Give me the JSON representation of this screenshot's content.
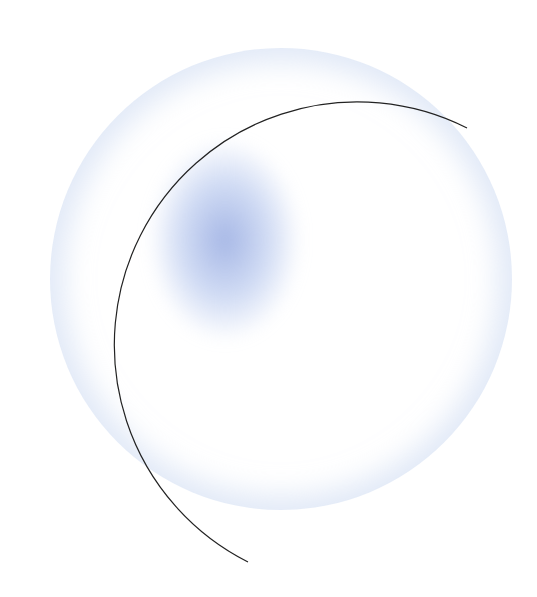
{
  "illustration": {
    "description": "Soft glowing sphere with partial dark outline arc and a blurred blue highlight",
    "colors": {
      "background": "#ffffff",
      "ring_glow": "#c8d7f0",
      "blob": "#96aae1",
      "arc_stroke": "#222222"
    }
  }
}
